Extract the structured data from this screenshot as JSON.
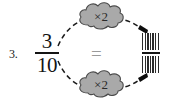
{
  "problem": {
    "number_label": "3.",
    "left_fraction": {
      "numerator": "3",
      "denominator": "10"
    },
    "relation_symbol": "=",
    "right_fraction": {
      "numerator": "",
      "denominator": "",
      "style": "hatched-blank"
    }
  },
  "operations": {
    "top_cloud_label": "×2",
    "bottom_cloud_label": "×2"
  },
  "icons": {
    "cloud_top": "cloud-shape",
    "cloud_bottom": "cloud-shape",
    "arrow_top": "dashed-curved-arrow-right",
    "arrow_bottom": "dashed-curved-arrow-right"
  },
  "colors": {
    "cloud_fill": "#a9a9a9",
    "cloud_stroke": "#4a4a4a",
    "arrow_stroke": "#1a1a1a",
    "text": "#141414",
    "equals": "#9a9a9a",
    "background": "#ffffff"
  }
}
